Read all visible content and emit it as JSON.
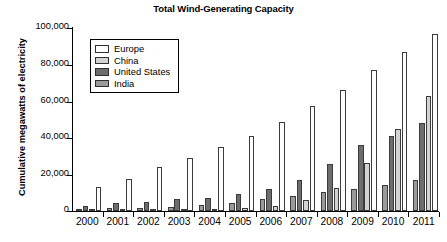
{
  "chart_data": {
    "type": "bar",
    "title": "Total Wind-Generating Capacity",
    "xlabel": "",
    "ylabel": "Cumulative megawatts of electricity",
    "categories": [
      "2000",
      "2001",
      "2002",
      "2003",
      "2004",
      "2005",
      "2006",
      "2007",
      "2008",
      "2009",
      "2010",
      "2011"
    ],
    "series": [
      {
        "name": "India",
        "color": "#9a9a9a",
        "values": [
          1200,
          1500,
          1700,
          2100,
          3000,
          4400,
          6300,
          8000,
          10000,
          11800,
          13800,
          16800
        ]
      },
      {
        "name": "United States",
        "color": "#6d6d6d",
        "values": [
          2600,
          4300,
          4700,
          6400,
          6800,
          9100,
          11600,
          17000,
          25800,
          35900,
          40800,
          47800
        ]
      },
      {
        "name": "China",
        "color": "#d3d3d3",
        "values": [
          350,
          400,
          500,
          600,
          800,
          1300,
          2600,
          6000,
          12200,
          26000,
          44800,
          62700
        ]
      },
      {
        "name": "Europe",
        "color": "#fdfdfd",
        "values": [
          13000,
          17400,
          23800,
          28900,
          34700,
          41000,
          48300,
          57300,
          66000,
          77000,
          86900,
          96600
        ]
      }
    ],
    "ylim": [
      0,
      100000
    ],
    "ytick_values": [
      0,
      20000,
      40000,
      60000,
      80000,
      100000
    ],
    "ytick_labels": [
      "0",
      "20,000",
      "40,000",
      "60,000",
      "80,000",
      "100,000"
    ],
    "grid": false,
    "legend_position": "upper-left-inside",
    "legend_entries": [
      "Europe",
      "China",
      "United States",
      "India"
    ]
  }
}
